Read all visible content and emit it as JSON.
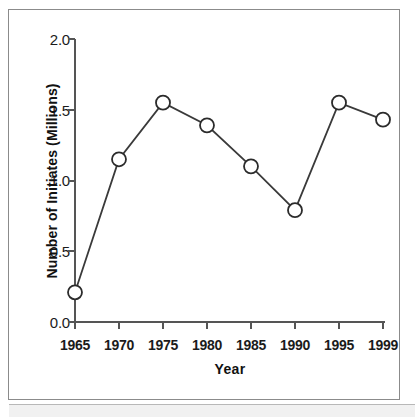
{
  "chart_data": {
    "type": "line",
    "title": "",
    "xlabel": "Year",
    "ylabel": "Number of Initiates (Millions)",
    "categories": [
      "1965",
      "1970",
      "1975",
      "1980",
      "1985",
      "1990",
      "1995",
      "1999"
    ],
    "x": [
      1965,
      1970,
      1975,
      1980,
      1985,
      1990,
      1995,
      1999
    ],
    "values": [
      0.21,
      1.15,
      1.55,
      1.39,
      1.1,
      0.79,
      1.55,
      1.43
    ],
    "series": [
      {
        "name": "Number of Initiates",
        "values": [
          0.21,
          1.15,
          1.55,
          1.39,
          1.1,
          0.79,
          1.55,
          1.43
        ]
      }
    ],
    "ylim": [
      0.0,
      2.0
    ],
    "yticks": [
      "0.0",
      "0.5",
      "1.0",
      "1.5",
      "2.0"
    ],
    "ytick_values": [
      0.0,
      0.5,
      1.0,
      1.5,
      2.0
    ],
    "xticks": [
      "1965",
      "1970",
      "1975",
      "1980",
      "1985",
      "1990",
      "1995",
      "1999"
    ],
    "grid": false,
    "legend": false,
    "legend_position": "none",
    "marker": "open-circle",
    "line_color": "#2b2b2b",
    "marker_fill": "#ffffff",
    "marker_edge": "#2b2b2b",
    "axis_color": "#555555"
  },
  "axes": {
    "y_tick_labels": [
      "2.0",
      "1.5",
      "1.0",
      "0.5",
      "0.0"
    ],
    "x_tick_labels": [
      "1965",
      "1970",
      "1975",
      "1980",
      "1985",
      "1990",
      "1995",
      "1999"
    ],
    "y_axis_title": "Number of Initiates (Millions)",
    "x_axis_title": "Year"
  }
}
